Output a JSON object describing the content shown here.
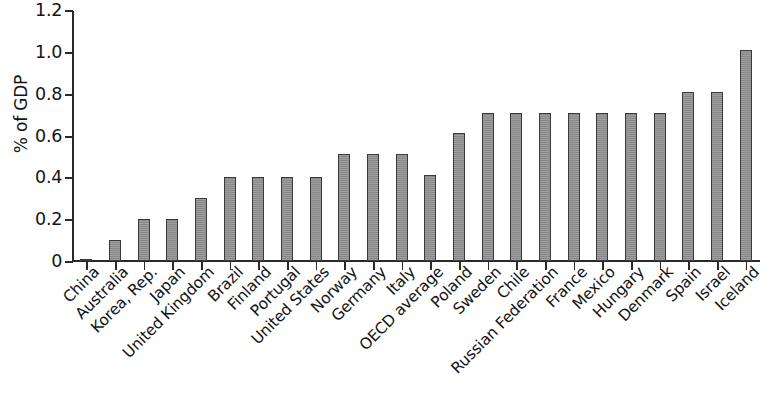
{
  "chart": {
    "type": "bar",
    "ylabel": "% of GDP",
    "title": "",
    "xlabel": ""
  },
  "chart_data": {
    "type": "bar",
    "title": "",
    "xlabel": "",
    "ylabel": "% of GDP",
    "ylim": [
      0,
      1.2
    ],
    "yticks": [
      "0",
      "0.2",
      "0.4",
      "0.6",
      "0.8",
      "1.0",
      "1.2"
    ],
    "ytick_values": [
      0,
      0.2,
      0.4,
      0.6,
      0.8,
      1.0,
      1.2
    ],
    "grid": false,
    "legend": false,
    "bar_color": "#8e8e8e",
    "bar_edge_color": "#3a3a3a",
    "categories": [
      "China",
      "Australia",
      "Korea, Rep.",
      "Japan",
      "United Kingdom",
      "Brazil",
      "Finland",
      "Portugal",
      "United States",
      "Norway",
      "Germany",
      "Italy",
      "OECD average",
      "Poland",
      "Sweden",
      "Chile",
      "Russian Federation",
      "France",
      "Mexico",
      "Hungary",
      "Denmark",
      "Spain",
      "Israel",
      "Iceland"
    ],
    "values": [
      0.01,
      0.1,
      0.2,
      0.2,
      0.3,
      0.4,
      0.4,
      0.4,
      0.4,
      0.51,
      0.51,
      0.51,
      0.41,
      0.61,
      0.71,
      0.71,
      0.71,
      0.71,
      0.71,
      0.71,
      0.71,
      0.81,
      0.81,
      1.01
    ]
  }
}
